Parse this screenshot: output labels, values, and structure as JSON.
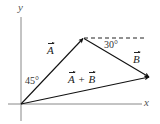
{
  "diagram": {
    "type": "vector-addition",
    "axes": {
      "x_label": "x",
      "y_label": "y"
    },
    "vectors": [
      {
        "name": "A",
        "label": "A",
        "from": "origin",
        "to": "tip-A",
        "angle_from_y_axis_deg": 45
      },
      {
        "name": "B",
        "label": "B",
        "from": "tip-A",
        "to": "tip-B",
        "angle_below_horizontal_deg": 30
      },
      {
        "name": "A+B",
        "label_left": "A",
        "operator": "+",
        "label_right": "B",
        "from": "origin",
        "to": "tip-B"
      }
    ],
    "angles": {
      "alpha": "45°",
      "beta": "30°"
    },
    "colors": {
      "axis": "#888888",
      "vector": "#111111",
      "dashed": "#222222",
      "background": "#ffffff"
    }
  }
}
